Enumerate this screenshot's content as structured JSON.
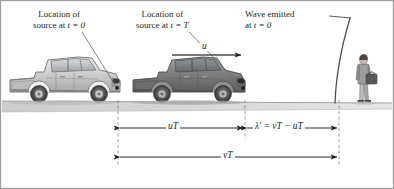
{
  "figure": {
    "type": "physics-diagram",
    "topic": "Doppler effect for a moving source",
    "background_color": "#ffffff",
    "ink_color": "#231f20"
  },
  "annotations": {
    "source_t0": {
      "line1": "Location of",
      "line2_prefix": "source at ",
      "line2_math": "t = 0",
      "x": 33,
      "y": 9
    },
    "source_tT": {
      "line1": "Location of",
      "line2_prefix": "source at ",
      "line2_math": "t = T",
      "x": 136,
      "y": 9
    },
    "wave_emitted": {
      "line1": "Wave emitted",
      "line2_prefix": "at ",
      "line2_math": "t = 0",
      "x": 245,
      "y": 9
    }
  },
  "velocity_arrow": {
    "label": "u",
    "description": "source velocity arrow pointing right",
    "x1": 173,
    "x2": 243,
    "y": 55
  },
  "dimensions": [
    {
      "name": "uT",
      "label": "uT",
      "label_plain": "uT",
      "x_start": 118,
      "x_end": 245,
      "y": 128,
      "meaning": "distance traveled by source in one period"
    },
    {
      "name": "lambda-prime",
      "label": "λ′ = vT − uT",
      "label_plain": "lambda' = vT - uT",
      "x_start": 245,
      "x_end": 339,
      "y": 128,
      "meaning": "compressed wavelength ahead of the source"
    },
    {
      "name": "vT",
      "label": "vT",
      "label_plain": "vT",
      "x_start": 118,
      "x_end": 339,
      "y": 157,
      "meaning": "distance traveled by the wave front in one period"
    }
  ],
  "guide_lines": [
    {
      "name": "source-t0-guide",
      "x": 118,
      "y_top": 100,
      "y_bottom": 166
    },
    {
      "name": "source-tT-guide",
      "x": 245,
      "y_top": 100,
      "y_bottom": 140
    },
    {
      "name": "wavefront-guide",
      "x": 339,
      "y_top": 100,
      "y_bottom": 166
    }
  ],
  "objects": {
    "truck_t0": {
      "name": "pickup-truck-light",
      "color": "#c9c9c9",
      "x": 8,
      "y": 56,
      "width": 114,
      "height": 46
    },
    "truck_tT": {
      "name": "pickup-truck-dark",
      "color": "#7d7d7d",
      "x": 131,
      "y": 57,
      "width": 116,
      "height": 45
    },
    "observer": {
      "name": "standing-observer-with-bag",
      "x": 355,
      "y": 55,
      "width": 22,
      "height": 48
    },
    "ground": {
      "name": "road-surface",
      "color": "#d4d4d4",
      "y": 101
    },
    "wavefront": {
      "name": "wave-front-arc",
      "description": "curved arc representing the emitted wave front",
      "x_top": 350,
      "x_bottom": 336
    }
  },
  "frame": {
    "border_color": "#9a9a9a",
    "visible": true
  }
}
